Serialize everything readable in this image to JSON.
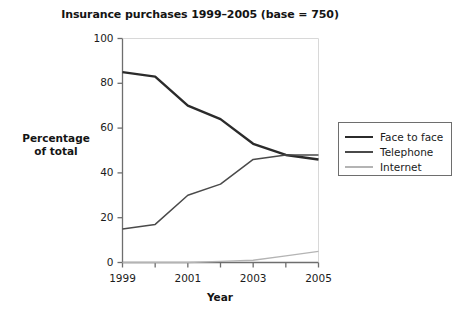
{
  "chart_data": {
    "type": "line",
    "title": "Insurance purchases 1999–2005 (base = 750)",
    "xlabel": "Year",
    "ylabel": "Percentage of total",
    "ylabel_line1": "Percentage",
    "ylabel_line2": "of total",
    "x": [
      1999,
      2000,
      2001,
      2002,
      2003,
      2004,
      2005
    ],
    "xlim": [
      1999,
      2005
    ],
    "ylim": [
      0,
      100
    ],
    "grid": false,
    "legend_position": "right",
    "x_tick_labels": [
      "1999",
      "2001",
      "2003",
      "2005"
    ],
    "x_tick_values": [
      1999,
      2001,
      2003,
      2005
    ],
    "x_minor_tick_values": [
      1999,
      2000,
      2001,
      2002,
      2003,
      2004,
      2005
    ],
    "y_tick_labels": [
      "0",
      "20",
      "40",
      "60",
      "80",
      "100"
    ],
    "y_tick_values": [
      0,
      20,
      40,
      60,
      80,
      100
    ],
    "series": [
      {
        "name": "Face to face",
        "color": "#2b2b2b",
        "width": 2.4,
        "values": [
          85,
          83,
          70,
          64,
          53,
          48,
          46
        ]
      },
      {
        "name": "Telephone",
        "color": "#4a4a4a",
        "width": 1.5,
        "values": [
          15,
          17,
          30,
          35,
          46,
          48,
          48
        ]
      },
      {
        "name": "Internet",
        "color": "#b4b4b4",
        "width": 1.3,
        "values": [
          0,
          0,
          0,
          0.5,
          1,
          3,
          5
        ]
      }
    ]
  },
  "legend": {
    "items": [
      {
        "label": "Face to face"
      },
      {
        "label": "Telephone"
      },
      {
        "label": "Internet"
      }
    ]
  },
  "axis_color": "#6e6e6e",
  "background": "#ffffff"
}
